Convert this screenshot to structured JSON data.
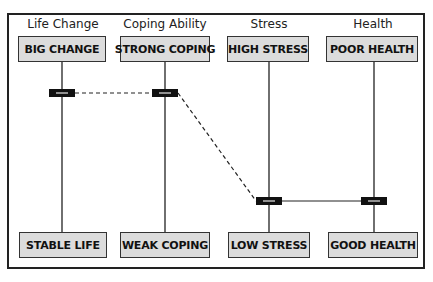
{
  "diagram": {
    "columns": [
      {
        "title": "Life Change",
        "top": "BIG CHANGE",
        "bottom": "STABLE LIFE",
        "marker_level": 0.8
      },
      {
        "title": "Coping Ability",
        "top": "STRONG COPING",
        "bottom": "WEAK COPING",
        "marker_level": 0.8
      },
      {
        "title": "Stress",
        "top": "HIGH STRESS",
        "bottom": "LOW STRESS",
        "marker_level": 0.2
      },
      {
        "title": "Health",
        "top": "POOR HEALTH",
        "bottom": "GOOD HEALTH",
        "marker_level": 0.2
      }
    ],
    "connections": [
      {
        "from": 0,
        "to": 1,
        "style": "dashed"
      },
      {
        "from": 1,
        "to": 2,
        "style": "dashed"
      },
      {
        "from": 2,
        "to": 3,
        "style": "solid"
      }
    ],
    "colors": {
      "box_fill": "#dcdcdc",
      "line": "#222222",
      "marker": "#111111"
    }
  }
}
